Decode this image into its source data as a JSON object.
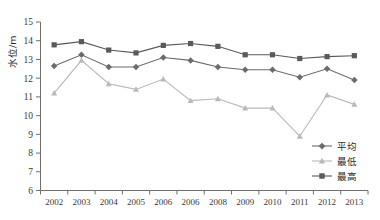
{
  "chart_data": {
    "type": "line",
    "title": "",
    "xlabel": "",
    "ylabel": "水位/m",
    "ylim": [
      6,
      15
    ],
    "ytick_step": 1,
    "yticks": [
      "6",
      "7",
      "8",
      "9",
      "10",
      "11",
      "12",
      "13",
      "14",
      "15"
    ],
    "grid": false,
    "legend_position": "bottom-right",
    "categories": [
      "2002",
      "2003",
      "2004",
      "2005",
      "2006",
      "2006",
      "2008",
      "2009",
      "2010",
      "2011",
      "2012",
      "2013"
    ],
    "series": [
      {
        "name": "平均",
        "marker": "diamond",
        "color": "#6b6b6b",
        "values": [
          12.65,
          13.25,
          12.6,
          12.6,
          13.1,
          12.95,
          12.6,
          12.45,
          12.45,
          12.05,
          12.5,
          11.9
        ]
      },
      {
        "name": "最低",
        "marker": "triangle",
        "color": "#b9b9b9",
        "values": [
          11.2,
          12.95,
          11.7,
          11.4,
          11.95,
          10.8,
          10.9,
          10.4,
          10.4,
          8.9,
          11.1,
          10.6
        ]
      },
      {
        "name": "最高",
        "marker": "square",
        "color": "#5a5a5a",
        "values": [
          13.78,
          13.95,
          13.5,
          13.35,
          13.75,
          13.85,
          13.7,
          13.25,
          13.25,
          13.05,
          13.15,
          13.2
        ]
      }
    ]
  },
  "legend": {
    "items": [
      {
        "label": "平均",
        "marker": "diamond",
        "color": "#6b6b6b"
      },
      {
        "label": "最低",
        "marker": "triangle",
        "color": "#b9b9b9"
      },
      {
        "label": "最高",
        "marker": "square",
        "color": "#5a5a5a"
      }
    ]
  },
  "axis": {
    "y_title": "水位/m",
    "axis_color": "#6e6e6e"
  }
}
